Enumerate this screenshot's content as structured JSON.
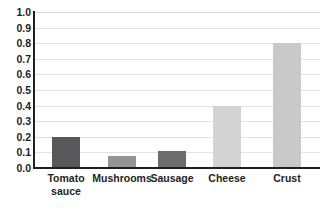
{
  "chart_data": {
    "type": "bar",
    "title": "",
    "xlabel": "",
    "ylabel": "",
    "categories": [
      "Tomato sauce",
      "Mushrooms",
      "Sausage",
      "Cheese",
      "Crust"
    ],
    "values": [
      0.2,
      0.075,
      0.11,
      0.4,
      0.8
    ],
    "ylim": [
      0.0,
      1.0
    ],
    "ytick_labels": [
      "1.0",
      "0.9",
      "0.8",
      "0.7",
      "0.6",
      "0.5",
      "0.4",
      "0.3",
      "0.2",
      "0.1",
      "0.0"
    ],
    "ytick_values": [
      1.0,
      0.9,
      0.8,
      0.7,
      0.6,
      0.5,
      0.4,
      0.3,
      0.2,
      0.1,
      0.0
    ],
    "grid": true,
    "legend": "none",
    "bar_colors": [
      "#58585a",
      "#949496",
      "#6d6d70",
      "#d3d3d3",
      "#c9c9c9"
    ],
    "colors": {
      "dark_bar": "#58585a",
      "light_bar": "#d3d3d3",
      "axis": "#231f20",
      "gridline": "#e3e3e3",
      "background": "#ffffff"
    }
  }
}
